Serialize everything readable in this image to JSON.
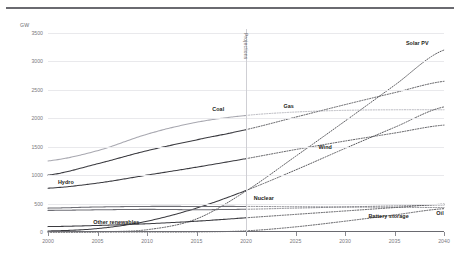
{
  "header": {
    "rule": "divider-rule"
  },
  "axis": {
    "unit": "GW",
    "yticks": [
      "0",
      "500",
      "1000",
      "1500",
      "2000",
      "2500",
      "3000",
      "3500"
    ],
    "xticks": [
      "2000",
      "2005",
      "2010",
      "2015",
      "2020",
      "2025",
      "2030",
      "2035",
      "2040"
    ]
  },
  "annotations": {
    "projections": "Projections",
    "projection_start_year": 2020
  },
  "colors": {
    "grid": "#e9e9ec",
    "axis": "#6a6a70",
    "text": "#7a7a80",
    "label": "#1d1d20",
    "line_dark": "#3b3b40",
    "line_mid": "#6e6e75",
    "line_light": "#a8a8b0"
  },
  "chart_data": {
    "type": "line",
    "title": "",
    "subtitle": "",
    "xlabel": "",
    "ylabel": "GW",
    "xlim": [
      2000,
      2040
    ],
    "ylim": [
      0,
      3500
    ],
    "ytick_step": 500,
    "xtick_step": 5,
    "grid": true,
    "legend": "inline-labels",
    "projection_split": 2020,
    "note": "Solid segments = historical (2000-2020), dotted segments = projection (2020-2040)",
    "x": [
      2000,
      2005,
      2010,
      2015,
      2020,
      2025,
      2030,
      2035,
      2040
    ],
    "series": [
      {
        "name": "Solar PV",
        "style": "dotted-projection",
        "color": "#3b3b40",
        "label_pos": {
          "x": 2037.3,
          "y": 3320
        },
        "values": [
          1,
          5,
          40,
          230,
          720,
          1330,
          1950,
          2580,
          3200
        ]
      },
      {
        "name": "Gas",
        "style": "solid-then-dotted",
        "color": "#3b3b40",
        "label_pos": {
          "x": 2024.3,
          "y": 2210
        },
        "values": [
          1000,
          1200,
          1430,
          1620,
          1800,
          2020,
          2240,
          2450,
          2650
        ]
      },
      {
        "name": "Coal",
        "style": "solid-then-dotted",
        "color": "#a8a8b0",
        "label_pos": {
          "x": 2017.2,
          "y": 2170
        },
        "values": [
          1250,
          1430,
          1720,
          1930,
          2050,
          2110,
          2140,
          2150,
          2150
        ]
      },
      {
        "name": "Wind",
        "style": "solid-then-dotted",
        "color": "#3b3b40",
        "label_pos": {
          "x": 2028.0,
          "y": 1490
        },
        "values": [
          18,
          60,
          190,
          420,
          730,
          1090,
          1470,
          1840,
          2200
        ]
      },
      {
        "name": "Hydro",
        "style": "solid-then-dotted",
        "color": "#3b3b40",
        "label_pos": {
          "x": 2001.8,
          "y": 880
        },
        "values": [
          770,
          860,
          1000,
          1140,
          1290,
          1450,
          1600,
          1740,
          1880
        ]
      },
      {
        "name": "Nuclear",
        "style": "solid-then-dotted",
        "color": "#6e6e75",
        "label_pos": {
          "x": 2021.8,
          "y": 600
        },
        "values": [
          380,
          390,
          398,
          392,
          400,
          420,
          440,
          460,
          475
        ]
      },
      {
        "name": "Oil",
        "style": "solid-then-dotted",
        "color": "#6e6e75",
        "label_pos": {
          "x": 2039.6,
          "y": 330
        },
        "values": [
          420,
          440,
          450,
          450,
          450,
          445,
          440,
          435,
          430
        ]
      },
      {
        "name": "Battery storage",
        "style": "dotted-projection",
        "color": "#3b3b40",
        "label_pos": {
          "x": 2034.4,
          "y": 285
        },
        "values": [
          0,
          0,
          0,
          2,
          20,
          90,
          190,
          300,
          410
        ]
      },
      {
        "name": "Other renewables",
        "style": "solid-then-dotted",
        "color": "#3b3b40",
        "label_pos": {
          "x": 2006.9,
          "y": 175
        },
        "values": [
          95,
          115,
          145,
          190,
          250,
          310,
          370,
          430,
          490
        ]
      }
    ]
  }
}
